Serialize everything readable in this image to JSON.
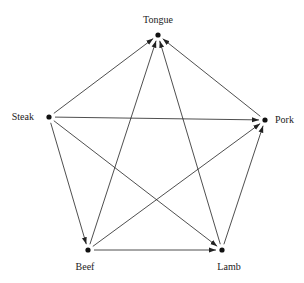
{
  "diagram": {
    "type": "directed-graph",
    "nodes": [
      {
        "id": "tongue",
        "label": "Tongue",
        "x": 158,
        "y": 35,
        "label_x": 158,
        "label_y": 23,
        "anchor": "middle"
      },
      {
        "id": "steak",
        "label": "Steak",
        "x": 49,
        "y": 117,
        "label_x": 34,
        "label_y": 120,
        "anchor": "end"
      },
      {
        "id": "pork",
        "label": "Pork",
        "x": 265,
        "y": 120,
        "label_x": 275,
        "label_y": 123,
        "anchor": "start"
      },
      {
        "id": "beef",
        "label": "Beef",
        "x": 88,
        "y": 250,
        "label_x": 85,
        "label_y": 270,
        "anchor": "middle"
      },
      {
        "id": "lamb",
        "label": "Lamb",
        "x": 222,
        "y": 250,
        "label_x": 229,
        "label_y": 270,
        "anchor": "middle"
      }
    ],
    "edges": [
      {
        "from": "steak",
        "to": "tongue"
      },
      {
        "from": "steak",
        "to": "pork"
      },
      {
        "from": "steak",
        "to": "beef"
      },
      {
        "from": "steak",
        "to": "lamb"
      },
      {
        "from": "beef",
        "to": "tongue"
      },
      {
        "from": "beef",
        "to": "pork"
      },
      {
        "from": "beef",
        "to": "lamb"
      },
      {
        "from": "lamb",
        "to": "tongue"
      },
      {
        "from": "lamb",
        "to": "pork"
      },
      {
        "from": "pork",
        "to": "tongue"
      }
    ]
  }
}
